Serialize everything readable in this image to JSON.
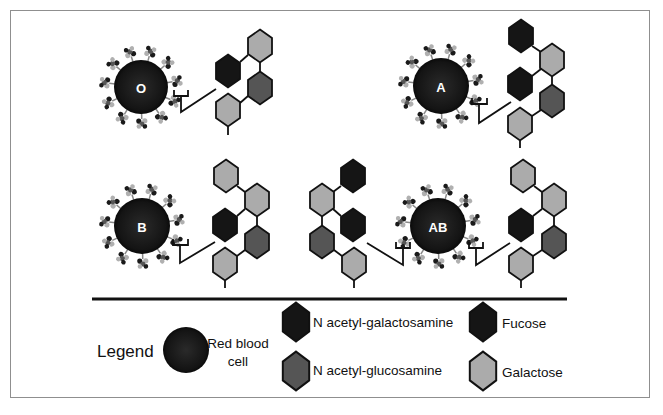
{
  "colors": {
    "red_blood_cell": "#1c1c1c",
    "n_acetyl_galactosamine": "#151515",
    "fucose": "#151515",
    "n_acetyl_glucosamine": "#555555",
    "galactose": "#ababab",
    "frame": "#8f8f8f"
  },
  "cells": [
    {
      "id": "O",
      "label": "O",
      "cx": 141,
      "cy": 87,
      "r": 27
    },
    {
      "id": "A",
      "label": "A",
      "cx": 441,
      "cy": 86,
      "r": 28
    },
    {
      "id": "B",
      "label": "B",
      "cx": 142,
      "cy": 226,
      "r": 28
    },
    {
      "id": "AB",
      "label": "AB",
      "cx": 438,
      "cy": 226,
      "r": 28
    }
  ],
  "antigen_chains": [
    {
      "group": "O",
      "sugars": [
        "Fucose",
        "Galactose",
        "N acetyl-glucosamine",
        "Galactose"
      ]
    },
    {
      "group": "A",
      "sugars": [
        "N acetyl-galactosamine",
        "Galactose",
        "Fucose",
        "N acetyl-glucosamine",
        "Galactose"
      ]
    },
    {
      "group": "B",
      "sugars": [
        "Galactose",
        "Galactose",
        "Fucose",
        "N acetyl-glucosamine",
        "Galactose"
      ]
    },
    {
      "group": "AB-left",
      "sugars": [
        "N acetyl-galactosamine",
        "Galactose",
        "Fucose",
        "N acetyl-glucosamine",
        "Galactose"
      ]
    },
    {
      "group": "AB-right",
      "sugars": [
        "Galactose",
        "Galactose",
        "Fucose",
        "N acetyl-glucosamine",
        "Galactose"
      ]
    }
  ],
  "legend": {
    "title": "Legend",
    "rbc_label_line1": "Red blood",
    "rbc_label_line2": "cell",
    "items": [
      {
        "label": "N acetyl-galactosamine",
        "color": "#151515"
      },
      {
        "label": "N acetyl-glucosamine",
        "color": "#555555"
      },
      {
        "label": "Fucose",
        "color": "#151515"
      },
      {
        "label": "Galactose",
        "color": "#ababab"
      }
    ]
  }
}
